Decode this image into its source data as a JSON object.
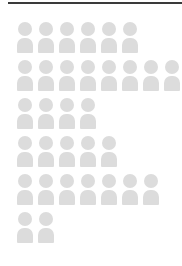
{
  "chart_data": {
    "type": "pictogram",
    "title": "",
    "subtitle": "",
    "xlabel": "",
    "ylabel": "",
    "legend": [],
    "grid": false,
    "icon": "person-icon",
    "icon_value": 1,
    "icon_color": "#dcdcdc",
    "orientation": "horizontal",
    "categories": [
      "Row 1",
      "Row 2",
      "Row 3",
      "Row 4",
      "Row 5",
      "Row 6"
    ],
    "values": [
      6,
      8,
      4,
      5,
      7,
      2
    ],
    "rows": [
      {
        "label": "Row 1",
        "count": 6
      },
      {
        "label": "Row 2",
        "count": 8
      },
      {
        "label": "Row 3",
        "count": 4
      },
      {
        "label": "Row 4",
        "count": 5
      },
      {
        "label": "Row 5",
        "count": 7
      },
      {
        "label": "Row 6",
        "count": 2
      }
    ],
    "total": 32,
    "max_value": 8,
    "xlim": [
      0,
      8
    ]
  },
  "figure": {
    "rule_color": "#3a3a3a",
    "background_color": "#ffffff"
  }
}
